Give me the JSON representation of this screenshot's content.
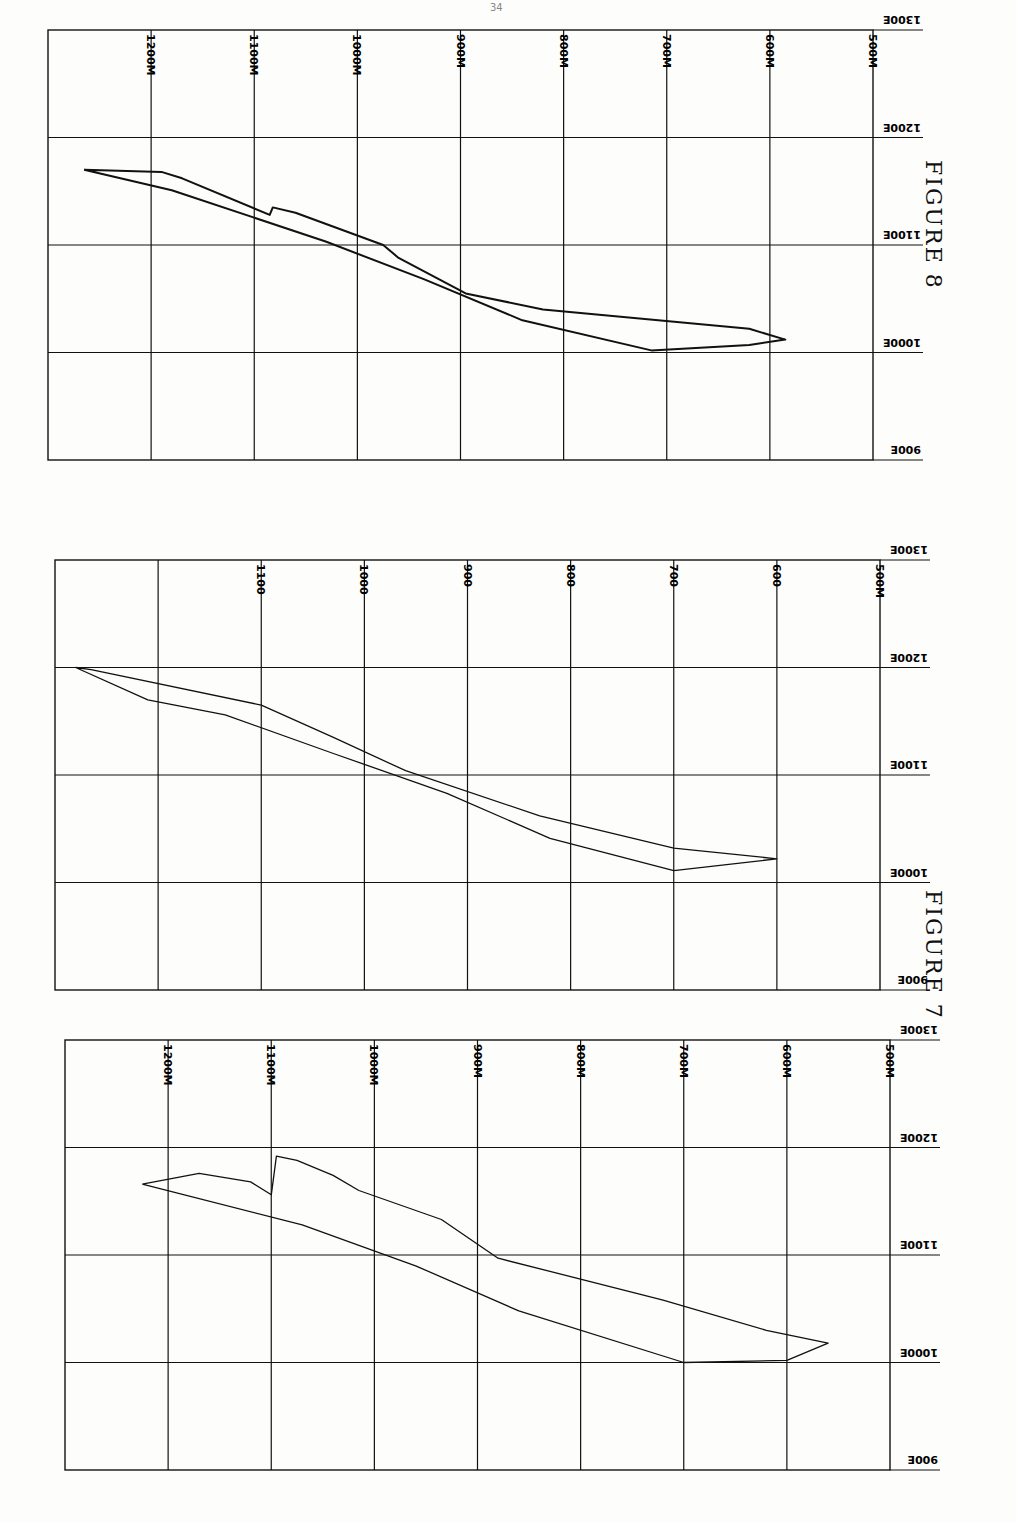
{
  "page": {
    "number": "34"
  },
  "captions": {
    "figure7": "FIGURE 7",
    "figure8": "FIGURE 8"
  },
  "chart_data": [
    {
      "type": "line",
      "title": "FIGURE 8",
      "xlabel": "Elevation (m)",
      "ylabel": "Easting",
      "x_ticks": [
        "1200M",
        "1100M",
        "1000M",
        "900M",
        "800M",
        "700M",
        "600M",
        "500M"
      ],
      "y_ticks": [
        "1300E",
        "1200E",
        "1100E",
        "1000E",
        "900E"
      ],
      "grid": true,
      "series": [
        {
          "name": "outline",
          "points": [
            [
              1265,
              1170
            ],
            [
              1190,
              1168
            ],
            [
              1170,
              1162
            ],
            [
              1085,
              1128
            ],
            [
              1082,
              1135
            ],
            [
              1060,
              1130
            ],
            [
              975,
              1100
            ],
            [
              960,
              1088
            ],
            [
              895,
              1055
            ],
            [
              820,
              1040
            ],
            [
              620,
              1022
            ],
            [
              585,
              1012
            ],
            [
              620,
              1007
            ],
            [
              715,
              1002
            ],
            [
              840,
              1030
            ],
            [
              935,
              1068
            ],
            [
              1030,
              1103
            ],
            [
              1180,
              1151
            ],
            [
              1265,
              1170
            ]
          ]
        }
      ]
    },
    {
      "type": "line",
      "title": "FIGURE 7 (upper)",
      "xlabel": "Elevation (m)",
      "ylabel": "Easting",
      "x_ticks": [
        "1100",
        "1000",
        "900",
        "800",
        "700",
        "600",
        "500M"
      ],
      "y_ticks": [
        "1300E",
        "1200E",
        "1100E",
        "1000E",
        "900E"
      ],
      "grid": true,
      "series": [
        {
          "name": "outline",
          "points": [
            [
              1280,
              1200
            ],
            [
              1265,
              1198
            ],
            [
              1100,
              1165
            ],
            [
              1030,
              1135
            ],
            [
              960,
              1104
            ],
            [
              830,
              1062
            ],
            [
              700,
              1032
            ],
            [
              600,
              1022
            ],
            [
              700,
              1011
            ],
            [
              820,
              1041
            ],
            [
              920,
              1083
            ],
            [
              1030,
              1120
            ],
            [
              1135,
              1156
            ],
            [
              1210,
              1170
            ],
            [
              1280,
              1200
            ]
          ]
        }
      ]
    },
    {
      "type": "line",
      "title": "FIGURE 7 (lower)",
      "xlabel": "Elevation (m)",
      "ylabel": "Easting",
      "x_ticks": [
        "1200M",
        "1100M",
        "1000M",
        "900M",
        "800M",
        "700M",
        "600M",
        "500M"
      ],
      "y_ticks": [
        "1300E",
        "1200E",
        "1100E",
        "1000E",
        "900E"
      ],
      "grid": true,
      "series": [
        {
          "name": "outline",
          "points": [
            [
              1225,
              1166
            ],
            [
              1170,
              1176
            ],
            [
              1120,
              1168
            ],
            [
              1100,
              1156
            ],
            [
              1095,
              1192
            ],
            [
              1075,
              1188
            ],
            [
              1040,
              1174
            ],
            [
              1015,
              1160
            ],
            [
              935,
              1133
            ],
            [
              880,
              1097
            ],
            [
              720,
              1058
            ],
            [
              620,
              1030
            ],
            [
              560,
              1018
            ],
            [
              600,
              1002
            ],
            [
              700,
              1000
            ],
            [
              860,
              1048
            ],
            [
              960,
              1090
            ],
            [
              1070,
              1128
            ],
            [
              1225,
              1166
            ]
          ]
        }
      ]
    }
  ]
}
